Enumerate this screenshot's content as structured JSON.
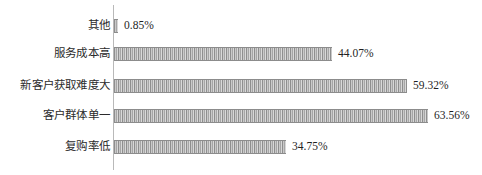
{
  "chart_data": {
    "type": "bar",
    "orientation": "horizontal",
    "title": "",
    "subtitle": "",
    "xlabel": "",
    "ylabel": "",
    "grid": false,
    "legend": null,
    "legend_position": "none",
    "xlim": [
      0,
      70
    ],
    "unit": "%",
    "axis_line_color": "#b9b9b9",
    "bar_color": "#9a9a9a",
    "bar_pattern": "vertical-stripes",
    "text_color": "#2b2b2b",
    "background": "#ffffff",
    "px_per_percent": 4.94,
    "categories": [
      "其他",
      "服务成本高",
      "新客户获取难度大",
      "客户群体单一",
      "复购率低"
    ],
    "values": [
      0.85,
      44.07,
      59.32,
      63.56,
      34.75
    ],
    "value_labels": [
      "0.85%",
      "44.07%",
      "59.32%",
      "63.56%",
      "34.75%"
    ],
    "bars": [
      {
        "label": "其他",
        "value": 0.85,
        "value_label": "0.85%"
      },
      {
        "label": "服务成本高",
        "value": 44.07,
        "value_label": "44.07%"
      },
      {
        "label": "新客户获取难度大",
        "value": 59.32,
        "value_label": "59.32%"
      },
      {
        "label": "客户群体单一",
        "value": 63.56,
        "value_label": "63.56%"
      },
      {
        "label": "复购率低",
        "value": 34.75,
        "value_label": "34.75%"
      }
    ]
  }
}
